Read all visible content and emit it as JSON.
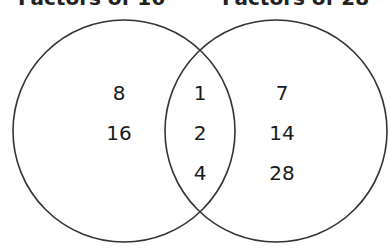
{
  "diagram": {
    "type": "venn",
    "sets": [
      {
        "label": "Factors of 16",
        "only": [
          "8",
          "16"
        ]
      },
      {
        "label": "Factors of 28",
        "only": [
          "7",
          "14",
          "28"
        ]
      }
    ],
    "intersection": [
      "1",
      "2",
      "4"
    ],
    "stroke_color": "#333333"
  }
}
